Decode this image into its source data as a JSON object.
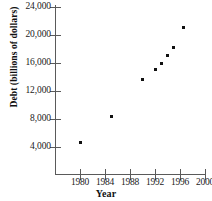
{
  "chart_data": {
    "type": "scatter",
    "title": "",
    "xlabel": "Year",
    "ylabel": "Debt (billions of dollars)",
    "xlim": [
      1976,
      2000
    ],
    "ylim": [
      0,
      24000
    ],
    "grid": false,
    "legend": "none",
    "x_ticks": [
      1980,
      1984,
      1988,
      1992,
      1996,
      2000
    ],
    "x_tick_labels": [
      "1980",
      "1984",
      "1988",
      "1992",
      "1996",
      "2000"
    ],
    "y_ticks": [
      4000,
      8000,
      12000,
      16000,
      20000,
      24000
    ],
    "y_tick_labels": [
      "4,000",
      "8,000",
      "12,000",
      "16,000",
      "20,000",
      "24,000"
    ],
    "point_color": "#111111",
    "axis_color": "#5a5a5a",
    "x": [
      1980,
      1985,
      1990,
      1992,
      1993,
      1994,
      1995,
      1996.5
    ],
    "y": [
      4600,
      8400,
      13700,
      15100,
      16000,
      17100,
      18200,
      21100
    ],
    "points": [
      {
        "x": 1980,
        "y": 4600
      },
      {
        "x": 1985,
        "y": 8400
      },
      {
        "x": 1990,
        "y": 13700
      },
      {
        "x": 1992,
        "y": 15100
      },
      {
        "x": 1993,
        "y": 16000
      },
      {
        "x": 1994,
        "y": 17100
      },
      {
        "x": 1995,
        "y": 18200
      },
      {
        "x": 1996.5,
        "y": 21100
      }
    ]
  }
}
